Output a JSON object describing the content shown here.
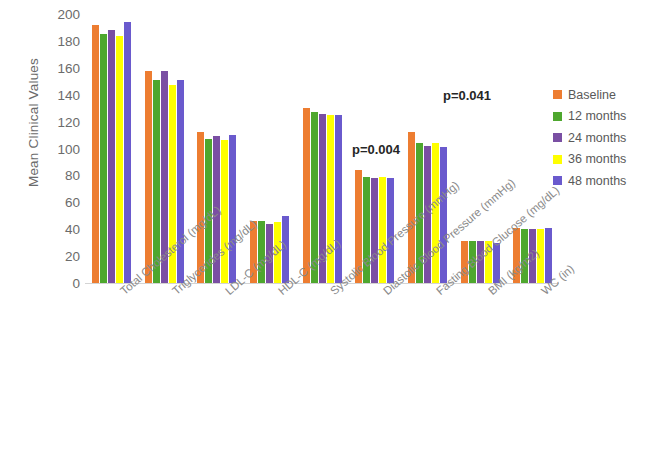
{
  "chart_data": {
    "type": "bar",
    "title": "",
    "xlabel": "",
    "ylabel": "Mean Clinical Values",
    "ylim": [
      0,
      200
    ],
    "yticks": [
      0,
      20,
      40,
      60,
      80,
      100,
      120,
      140,
      160,
      180,
      200
    ],
    "grid": false,
    "legend_position": "right",
    "categories": [
      "Total Cholesterol (mg/dL)",
      "Triglycerides (mg/dL)",
      "LDL-C (mg/dL)",
      "HDL-C (mg/dL)",
      "Systolic Blood Pressure (mmHg)",
      "Diastolic Blood Pressure (mmHg)",
      "Fasting Blood Glucose (mg/dL)",
      "BMI (kg/m2)",
      "WC (in)"
    ],
    "series": [
      {
        "name": "Baseline",
        "color": "#ed7d31",
        "values": [
          192,
          158,
          112,
          46,
          130,
          84,
          112,
          31,
          41
        ]
      },
      {
        "name": "12 months",
        "color": "#4ea72e",
        "values": [
          185,
          151,
          107,
          46,
          127,
          79,
          104,
          31,
          40
        ]
      },
      {
        "name": "24 months",
        "color": "#7a4fa3",
        "values": [
          188,
          158,
          109,
          44,
          126,
          78,
          102,
          31,
          40
        ]
      },
      {
        "name": "36 months",
        "color": "#ffff00",
        "values": [
          184,
          147,
          106,
          45,
          125,
          79,
          104,
          31,
          40
        ]
      },
      {
        "name": "48 months",
        "color": "#6a5acd",
        "values": [
          194,
          151,
          110,
          50,
          125,
          78,
          101,
          30,
          41
        ]
      }
    ],
    "annotations": [
      {
        "text": "p=0.004",
        "category": "Diastolic Blood Pressure (mmHg)"
      },
      {
        "text": "p=0.041",
        "category": "Fasting Blood Glucose (mg/dL)"
      }
    ]
  }
}
